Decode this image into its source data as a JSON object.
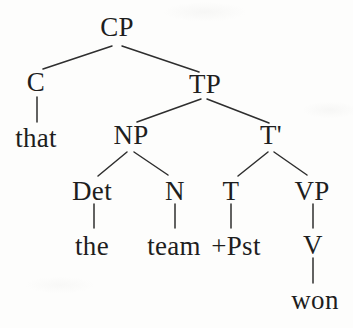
{
  "diagram": {
    "type": "syntax-tree",
    "sentence": "that the team won",
    "nodes": {
      "cp": {
        "label": "CP"
      },
      "c": {
        "label": "C"
      },
      "tp": {
        "label": "TP"
      },
      "that": {
        "label": "that"
      },
      "np": {
        "label": "NP"
      },
      "tbar": {
        "label": "T'"
      },
      "det": {
        "label": "Det"
      },
      "n": {
        "label": "N"
      },
      "t": {
        "label": "T"
      },
      "vp": {
        "label": "VP"
      },
      "the": {
        "label": "the"
      },
      "team": {
        "label": "team"
      },
      "pst": {
        "label": "+Pst"
      },
      "v": {
        "label": "V"
      },
      "won": {
        "label": "won"
      }
    },
    "edges": [
      {
        "from": "CP",
        "to": "C"
      },
      {
        "from": "CP",
        "to": "TP"
      },
      {
        "from": "C",
        "to": "that"
      },
      {
        "from": "TP",
        "to": "NP"
      },
      {
        "from": "TP",
        "to": "T'"
      },
      {
        "from": "NP",
        "to": "Det"
      },
      {
        "from": "NP",
        "to": "N"
      },
      {
        "from": "T'",
        "to": "T"
      },
      {
        "from": "T'",
        "to": "VP"
      },
      {
        "from": "Det",
        "to": "the"
      },
      {
        "from": "N",
        "to": "team"
      },
      {
        "from": "T",
        "to": "+Pst"
      },
      {
        "from": "VP",
        "to": "V"
      },
      {
        "from": "V",
        "to": "won"
      }
    ],
    "colors": {
      "text": "#1e1e1e",
      "line": "#2e2e2e",
      "background": "#fdfdfc"
    }
  }
}
